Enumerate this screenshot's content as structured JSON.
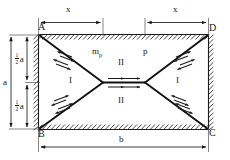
{
  "figure": {
    "corners": {
      "top_left": "A",
      "top_right": "D",
      "bottom_left": "B",
      "bottom_right": "C"
    },
    "dimensions": {
      "top_left_span": "x",
      "top_right_span": "x",
      "bottom_span": "b",
      "left_total": "a",
      "left_upper_half": "a",
      "left_upper_half_fraction_num": "1",
      "left_upper_half_fraction_den": "2",
      "left_lower_half": "a",
      "left_lower_half_fraction_num": "1",
      "left_lower_half_fraction_den": "2"
    },
    "labels": {
      "moment": "m",
      "moment_subscript": "p",
      "pressure": "p",
      "region_left": "I",
      "region_right": "I",
      "region_top": "II",
      "region_bottom": "II"
    },
    "colors": {
      "line": "#1a1a1a",
      "yield_line": "#111111",
      "background": "#ffffff",
      "hatch": "#333333"
    }
  }
}
